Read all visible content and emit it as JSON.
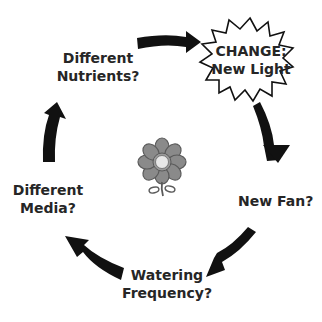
{
  "diagram": {
    "type": "cycle",
    "center_icon": "flower-icon",
    "change": {
      "line1": "CHANGE:",
      "line2": "New Light"
    },
    "nodes": [
      {
        "id": "new-fan",
        "line1": "New Fan?",
        "line2": ""
      },
      {
        "id": "watering-frequency",
        "line1": "Watering",
        "line2": "Frequency?"
      },
      {
        "id": "different-media",
        "line1": "Different",
        "line2": "Media?"
      },
      {
        "id": "different-nutrients",
        "line1": "Different",
        "line2": "Nutrients?"
      }
    ],
    "colors": {
      "arrow": "#111111",
      "text": "#262626",
      "flower_petal": "#8a8a8a",
      "flower_center": "#e6e6e6"
    }
  }
}
